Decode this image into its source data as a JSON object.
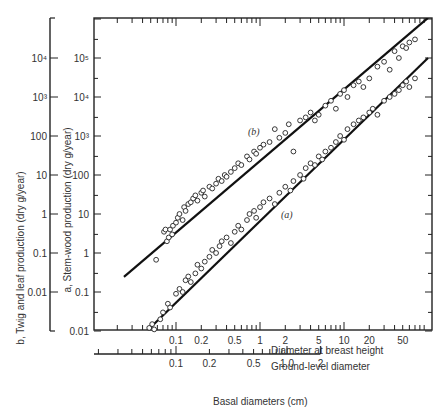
{
  "chart_data": {
    "type": "scatter",
    "title": "",
    "xlabel": "Basal diameters (cm)",
    "x_axes": [
      {
        "name": "Diameter at breast height",
        "scale": "log",
        "ticks": [
          "0.1",
          "0.2",
          "0.5",
          "1",
          "2",
          "5",
          "10",
          "20",
          "50"
        ],
        "range": [
          0.024,
          100
        ]
      },
      {
        "name": "Ground-level diameter",
        "scale": "log",
        "ticks": [
          "0.1",
          "0.2",
          "0.5",
          "1.0",
          "2"
        ],
        "range": [
          0.05,
          2
        ]
      }
    ],
    "y_axes": [
      {
        "name": "a, Stem-wood production (dry g/year)",
        "scale": "log",
        "ticks": [
          "0.01",
          "0.1",
          "1",
          "10",
          "100",
          "10³",
          "10⁴",
          "10⁵"
        ],
        "range": [
          0.01,
          1000000
        ]
      },
      {
        "name": "b, Twig and leaf production (dry g/year)",
        "scale": "log",
        "ticks": [
          "0.01",
          "0.1",
          "1",
          "10",
          "100",
          "10³",
          "10⁴"
        ],
        "range": [
          0.001,
          100000
        ]
      }
    ],
    "grid": false,
    "legend": null,
    "series": [
      {
        "name": "(b)",
        "label": "Twig and leaf production",
        "fit_line": {
          "x": [
            0.024,
            100
          ],
          "y_on_a_axis": [
            0.243,
            1070000
          ]
        },
        "points": [
          [
            0.058,
            0.67
          ],
          [
            0.072,
            3.5
          ],
          [
            0.075,
            4.0
          ],
          [
            0.078,
            2.0
          ],
          [
            0.082,
            2.5
          ],
          [
            0.085,
            4.0
          ],
          [
            0.09,
            3.0
          ],
          [
            0.092,
            5.0
          ],
          [
            0.1,
            6.0
          ],
          [
            0.105,
            8.0
          ],
          [
            0.11,
            10.0
          ],
          [
            0.12,
            7.0
          ],
          [
            0.125,
            15.0
          ],
          [
            0.13,
            12.0
          ],
          [
            0.14,
            18.0
          ],
          [
            0.15,
            20.0
          ],
          [
            0.16,
            25.0
          ],
          [
            0.17,
            30.0
          ],
          [
            0.18,
            22.0
          ],
          [
            0.2,
            35.0
          ],
          [
            0.21,
            40.0
          ],
          [
            0.22,
            28.0
          ],
          [
            0.25,
            50.0
          ],
          [
            0.27,
            45.0
          ],
          [
            0.3,
            60.0
          ],
          [
            0.32,
            80.0
          ],
          [
            0.35,
            70.0
          ],
          [
            0.38,
            100.0
          ],
          [
            0.4,
            90.0
          ],
          [
            0.45,
            120.0
          ],
          [
            0.5,
            150.0
          ],
          [
            0.55,
            200.0
          ],
          [
            0.6,
            180.0
          ],
          [
            0.7,
            300.0
          ],
          [
            0.75,
            250.0
          ],
          [
            0.85,
            400.0
          ],
          [
            0.9,
            350.0
          ],
          [
            1.0,
            500.0
          ],
          [
            1.1,
            600.0
          ],
          [
            1.3,
            700.0
          ],
          [
            1.5,
            1500.0
          ],
          [
            1.7,
            900.0
          ],
          [
            2.0,
            1200.0
          ],
          [
            2.2,
            2000.0
          ],
          [
            2.5,
            400.0
          ],
          [
            3.0,
            2500.0
          ],
          [
            3.5,
            3000.0
          ],
          [
            4.0,
            4000.0
          ],
          [
            4.5,
            2500.0
          ],
          [
            5.0,
            3500.0
          ],
          [
            6.0,
            6000.0
          ],
          [
            7.0,
            8000.0
          ],
          [
            8.0,
            5000.0
          ],
          [
            9.0,
            12000.0
          ],
          [
            10.0,
            15000.0
          ],
          [
            11.0,
            10000.0
          ],
          [
            13.0,
            20000.0
          ],
          [
            15.0,
            25000.0
          ],
          [
            17.0,
            18000.0
          ],
          [
            20.0,
            30000.0
          ],
          [
            25.0,
            60000.0
          ],
          [
            30.0,
            80000.0
          ],
          [
            35.0,
            50000.0
          ],
          [
            40.0,
            150000.0
          ],
          [
            45.0,
            100000.0
          ],
          [
            50.0,
            200000.0
          ],
          [
            55.0,
            180000.0
          ],
          [
            60.0,
            250000.0
          ],
          [
            70.0,
            300000.0
          ]
        ]
      },
      {
        "name": "(a)",
        "label": "Stem-wood production",
        "fit_line": {
          "x": [
            0.045,
            100
          ],
          "y_on_a_axis": [
            0.01,
            100000
          ]
        },
        "points": [
          [
            0.048,
            0.012
          ],
          [
            0.052,
            0.015
          ],
          [
            0.055,
            0.011
          ],
          [
            0.065,
            0.02
          ],
          [
            0.07,
            0.03
          ],
          [
            0.08,
            0.05
          ],
          [
            0.085,
            0.04
          ],
          [
            0.1,
            0.09
          ],
          [
            0.11,
            0.12
          ],
          [
            0.12,
            0.1
          ],
          [
            0.13,
            0.2
          ],
          [
            0.14,
            0.25
          ],
          [
            0.15,
            0.18
          ],
          [
            0.17,
            0.3
          ],
          [
            0.18,
            0.5
          ],
          [
            0.2,
            0.4
          ],
          [
            0.22,
            0.6
          ],
          [
            0.25,
            0.8
          ],
          [
            0.27,
            1.2
          ],
          [
            0.3,
            1.0
          ],
          [
            0.33,
            1.5
          ],
          [
            0.35,
            2.0
          ],
          [
            0.4,
            2.5
          ],
          [
            0.45,
            1.8
          ],
          [
            0.5,
            3.5
          ],
          [
            0.55,
            5.0
          ],
          [
            0.6,
            4.0
          ],
          [
            0.7,
            7.0
          ],
          [
            0.75,
            10.0
          ],
          [
            0.85,
            12.0
          ],
          [
            0.9,
            8.0
          ],
          [
            1.0,
            15.0
          ],
          [
            1.1,
            20.0
          ],
          [
            1.3,
            25.0
          ],
          [
            1.5,
            18.0
          ],
          [
            1.7,
            35.0
          ],
          [
            2.0,
            50.0
          ],
          [
            2.3,
            40.0
          ],
          [
            2.5,
            70.0
          ],
          [
            3.0,
            100.0
          ],
          [
            3.3,
            80.0
          ],
          [
            3.5,
            150.0
          ],
          [
            4.0,
            200.0
          ],
          [
            4.5,
            180.0
          ],
          [
            5.0,
            300.0
          ],
          [
            5.5,
            250.0
          ],
          [
            6.0,
            400.0
          ],
          [
            7.0,
            500.0
          ],
          [
            8.0,
            700.0
          ],
          [
            9.0,
            1000.0
          ],
          [
            10.0,
            800.0
          ],
          [
            11.0,
            1500.0
          ],
          [
            13.0,
            2000.0
          ],
          [
            15.0,
            2500.0
          ],
          [
            17.0,
            3000.0
          ],
          [
            20.0,
            4000.0
          ],
          [
            22.0,
            5000.0
          ],
          [
            25.0,
            3500.0
          ],
          [
            30.0,
            8000.0
          ],
          [
            35.0,
            10000.0
          ],
          [
            40.0,
            12000.0
          ],
          [
            45.0,
            15000.0
          ],
          [
            50.0,
            20000.0
          ],
          [
            55.0,
            25000.0
          ],
          [
            60.0,
            18000.0
          ],
          [
            70.0,
            30000.0
          ]
        ]
      }
    ]
  },
  "labels": {
    "y_outer_title": "b, Twig and leaf production (dry g/year)",
    "y_inner_title": "a, Stem-wood production (dry g/year)",
    "x_dbh_title": "Diameter at breast height",
    "x_ground_title": "Ground-level diameter",
    "x_main_title": "Basal diameters (cm)",
    "series_b_label": "(b)",
    "series_a_label": "(a)"
  },
  "style": {
    "line_color": "#111111",
    "axis_color": "#222222",
    "marker_stroke": "#222222",
    "text_color": "#333333"
  }
}
